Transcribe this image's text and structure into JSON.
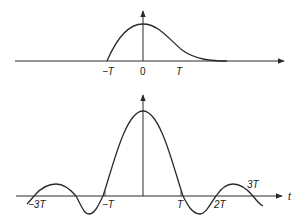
{
  "diagram": {
    "top_plot": {
      "description": "Asymmetric pulse starting at -T, peaking at 0, decaying toward zero after T",
      "x_labels": [
        {
          "id": "neg-T",
          "text": "−T",
          "t": -1
        },
        {
          "id": "zero",
          "text": "0",
          "t": 0
        },
        {
          "id": "pos-T",
          "text": "T",
          "t": 1
        }
      ],
      "curve": {
        "start_t": -1,
        "peak_t": 0,
        "end_t": 2.3
      }
    },
    "bottom_plot": {
      "description": "Sinc-like pulse with zero crossings at multiples of T",
      "axis_label": "t",
      "x_labels": [
        {
          "id": "neg-3T",
          "text": "−3T",
          "t": -3
        },
        {
          "id": "neg-T",
          "text": "−T",
          "t": -1
        },
        {
          "id": "pos-T",
          "text": "T",
          "t": 1
        },
        {
          "id": "pos-2T",
          "text": "2T",
          "t": 2
        },
        {
          "id": "pos-3T",
          "text": "3T",
          "t": 3
        }
      ],
      "zero_crossings_t": [
        -3,
        -2,
        -1,
        1,
        2,
        3
      ]
    }
  }
}
